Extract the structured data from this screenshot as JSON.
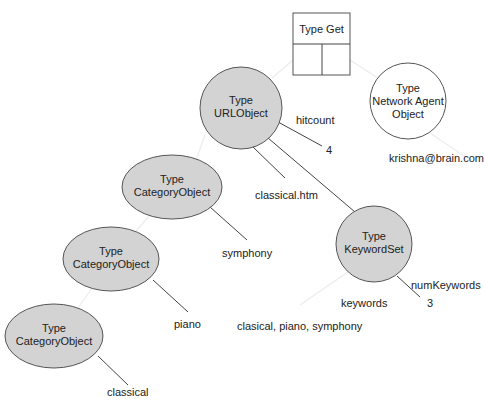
{
  "diagram": {
    "colors": {
      "node_fill": "#d3d3d3",
      "stroke": "#555555",
      "text": "#222222"
    },
    "type_get_box": {
      "title": "Type Get"
    },
    "nodes": {
      "url_object": {
        "line1": "Type",
        "line2": "URLObject"
      },
      "network_agent": {
        "line1": "Type",
        "line2": "Network Agent",
        "line3": "Object"
      },
      "keyword_set": {
        "line1": "Type",
        "line2": "KeywordSet"
      },
      "category_1": {
        "line1": "Type",
        "line2": "CategoryObject"
      },
      "category_2": {
        "line1": "Type",
        "line2": "CategoryObject"
      },
      "category_3": {
        "line1": "Type",
        "line2": "CategoryObject"
      }
    },
    "labels": {
      "hitcount": "hitcount",
      "hitcount_value": "4",
      "url_value": "classical.htm",
      "agent_value": "krishna@brain.com",
      "cat1_value": "symphony",
      "cat2_value": "piano",
      "cat3_value": "classical",
      "num_keywords": "numKeywords",
      "num_keywords_value": "3",
      "keywords": "keywords",
      "keywords_value": "clasical, piano, symphony"
    }
  }
}
